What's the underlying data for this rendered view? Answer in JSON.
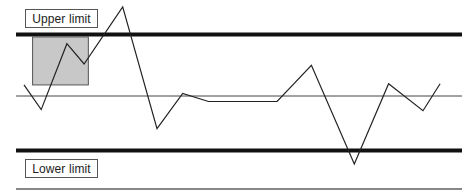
{
  "diagram": {
    "type": "control-chart",
    "labels": {
      "upper": "Upper limit",
      "lower": "Lower limit"
    },
    "colors": {
      "line": "#222222",
      "limit_line": "#111111",
      "highlight_fill": "#c8c8c8",
      "highlight_stroke": "#555555",
      "center_line": "#444444"
    }
  },
  "chart_data": {
    "type": "line",
    "title": "",
    "xlabel": "",
    "ylabel": "",
    "upper_limit": 1.0,
    "center": 0.0,
    "lower_limit": -1.0,
    "ylim": [
      -1.4,
      1.45
    ],
    "x": [
      0,
      1,
      2,
      3,
      4,
      5,
      6,
      7,
      8,
      9,
      10,
      11,
      12,
      13
    ],
    "x_positions": [
      0.0,
      0.04,
      0.1,
      0.14,
      0.23,
      0.31,
      0.37,
      0.43,
      0.59,
      0.67,
      0.77,
      0.85,
      0.93,
      0.97
    ],
    "values": [
      0.18,
      -0.25,
      0.85,
      0.52,
      1.45,
      -0.6,
      0.04,
      -0.1,
      -0.1,
      0.5,
      -1.25,
      0.2,
      -0.27,
      0.2
    ],
    "highlight_region": {
      "x_from": 0.02,
      "x_to": 0.15,
      "y_from": 0.18,
      "y_to": 0.96
    }
  }
}
